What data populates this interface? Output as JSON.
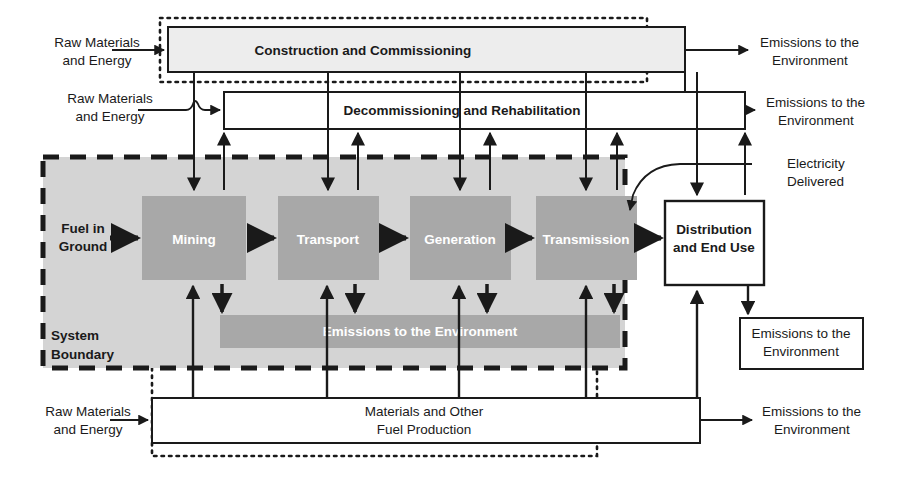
{
  "diagram": {
    "colors": {
      "system_fill": "#d4d4d4",
      "process_fill": "#a8a8a8",
      "emissions_bar_fill": "#a8a8a8",
      "box_fill": "#ededed",
      "stroke": "#1a1a1a",
      "text": "#1a1a1a",
      "text_on_process": "#ffffff"
    },
    "boxes": {
      "construction": {
        "label": "Construction and Commissioning"
      },
      "decommissioning": {
        "label": "Decommissioning and Rehabilitation"
      },
      "materials_production": {
        "line1": "Materials and Other",
        "line2": "Fuel Production"
      },
      "distribution": {
        "line1": "Distribution",
        "line2": "and End Use"
      },
      "emissions_enduse": {
        "line1": "Emissions to the",
        "line2": "Environment"
      }
    },
    "processes": [
      {
        "label": "Mining"
      },
      {
        "label": "Transport"
      },
      {
        "label": "Generation"
      },
      {
        "label": "Transmission"
      }
    ],
    "emissions_bar": {
      "label": "Emissions to the Environment"
    },
    "system_boundary": {
      "line1": "System",
      "line2": "Boundary"
    },
    "inputs": [
      {
        "line1": "Raw Materials",
        "line2": "and Energy"
      },
      {
        "line1": "Raw Materials",
        "line2": "and Energy"
      },
      {
        "line1": "Raw Materials",
        "line2": "and Energy"
      },
      {
        "line1": "Fuel in",
        "line2": "Ground"
      }
    ],
    "outputs": [
      {
        "line1": "Emissions to the",
        "line2": "Environment"
      },
      {
        "line1": "Emissions to the",
        "line2": "Environment"
      },
      {
        "line1": "Emissions to the",
        "line2": "Environment"
      },
      {
        "line1": "Electricity",
        "line2": "Delivered"
      }
    ]
  }
}
